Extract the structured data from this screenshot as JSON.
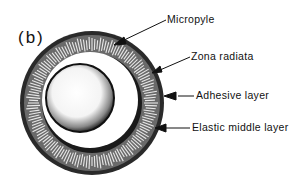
{
  "panel_label": "(b)",
  "labels": [
    {
      "id": "micropyle",
      "text": "Micropyle"
    },
    {
      "id": "zona-radiata",
      "text": "Zona radiata"
    },
    {
      "id": "adhesive-layer",
      "text": "Adhesive layer"
    },
    {
      "id": "elastic-middle-layer",
      "text": "Elastic middle layer"
    }
  ],
  "colors": {
    "ink": "#111111",
    "background": "#ffffff"
  }
}
